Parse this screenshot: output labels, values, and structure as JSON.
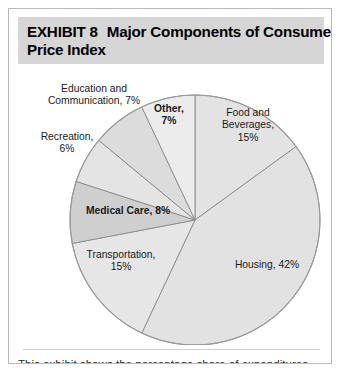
{
  "exhibit": {
    "header_line1_label": "EXHIBIT 8",
    "header_line1_title": "Major Components of Consumer",
    "header_line2_title": "Price Index",
    "caption": "This exhibit shows the percentage share of expenditures"
  },
  "labels": {
    "education": "Education and\nCommunication, 7%",
    "education_line1": "Education and",
    "education_line2": "Communication, 7%",
    "recreation_line1": "Recreation,",
    "recreation_line2": "6%",
    "other_line1": "Other,",
    "other_line2": "7%",
    "food_line1": "Food and",
    "food_line2": "Beverages,",
    "food_line3": "15%",
    "medical": "Medical Care, 8%",
    "transport_line1": "Transportation,",
    "transport_line2": "15%",
    "housing": "Housing, 42%"
  },
  "colors": {
    "header_band": "#d6d6d6",
    "card_border": "#b9b9b9",
    "slice_light": "#e9e9e9",
    "slice_mid": "#e0e0e0",
    "slice_dark": "#d0d0d0",
    "slice_outline": "#8a8a8a",
    "text": "#1a1a1a",
    "caption_text": "#2b2b2b"
  },
  "chart_data": {
    "type": "pie",
    "subtitle": "",
    "xlabel": "",
    "ylabel": "",
    "units": "percent",
    "legend_position": "none",
    "labels_inside": true,
    "start_angle_deg": 0,
    "direction": "clockwise",
    "categories": [
      "Food and Beverages",
      "Housing",
      "Transportation",
      "Medical Care",
      "Recreation",
      "Education and Communication",
      "Other"
    ],
    "values": [
      15,
      42,
      15,
      8,
      6,
      7,
      7
    ],
    "value_labels": [
      "15%",
      "42%",
      "15%",
      "8%",
      "6%",
      "7%",
      "7%"
    ],
    "slice_fills": [
      "#e3e3e3",
      "#e2e2e2",
      "#e6e6e6",
      "#cfcfcf",
      "#e4e4e4",
      "#dcdcdc",
      "#ececec"
    ],
    "total": 100
  }
}
